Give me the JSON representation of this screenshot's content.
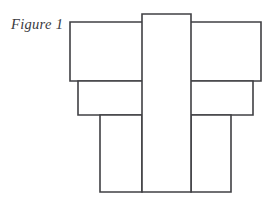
{
  "figure": {
    "caption": "Figure 1",
    "background_color": "#ffffff",
    "stroke_color": "#404044",
    "fill_color": "#ffffff",
    "stroke_width": 1.6,
    "canvas": {
      "width": 276,
      "height": 208
    }
  },
  "chart_data": {
    "type": "diagram",
    "title": "Figure 1",
    "subtitle": "",
    "xlabel": "",
    "ylabel": "",
    "units": "pixels",
    "shapes": [
      {
        "name": "upper-horizontal-bar",
        "label": "",
        "x": 70,
        "y": 22,
        "width": 191,
        "height": 59,
        "x2": 261,
        "y2": 81,
        "fill": "#ffffff",
        "stroke": "#404044"
      },
      {
        "name": "middle-horizontal-bar",
        "label": "",
        "x": 78,
        "y": 81,
        "width": 175,
        "height": 34,
        "x2": 253,
        "y2": 115,
        "fill": "#ffffff",
        "stroke": "#404044"
      },
      {
        "name": "central-vertical-bar",
        "label": "",
        "x": 142,
        "y": 14,
        "width": 49,
        "height": 178,
        "x2": 191,
        "y2": 192,
        "fill": "#ffffff",
        "stroke": "#404044"
      },
      {
        "name": "lower-left-block",
        "label": "",
        "x": 100,
        "y": 115,
        "width": 42,
        "height": 77,
        "x2": 142,
        "y2": 192,
        "fill": "#ffffff",
        "stroke": "#404044"
      },
      {
        "name": "lower-right-block",
        "label": "",
        "x": 191,
        "y": 115,
        "width": 40,
        "height": 77,
        "x2": 231,
        "y2": 192,
        "fill": "#ffffff",
        "stroke": "#404044"
      }
    ],
    "legend": [],
    "annotations": [
      {
        "name": "caption",
        "text": "Figure 1",
        "x": 11,
        "y": 28
      }
    ],
    "grid": false,
    "legend_position": "none"
  }
}
